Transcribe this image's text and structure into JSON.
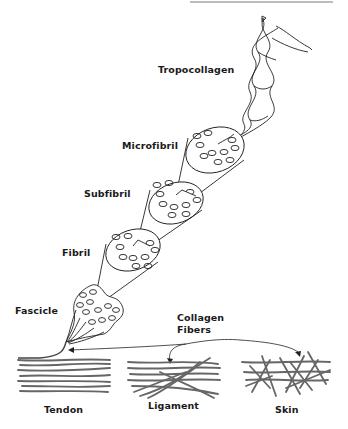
{
  "diagram": {
    "type": "collagen hierarchical structure",
    "labels": {
      "tropocollagen": "Tropocollagen",
      "microfibril": "Microfibril",
      "subfibril": "Subfibril",
      "fibril": "Fibril",
      "fascicle": "Fascicle",
      "collagen_fibers": "Collagen\nFibers",
      "tendon": "Tendon",
      "ligament": "Ligament",
      "skin": "Skin"
    },
    "hierarchy": [
      "Tropocollagen",
      "Microfibril",
      "Subfibril",
      "Fibril",
      "Fascicle",
      "Collagen Fibers"
    ],
    "tissues": [
      "Tendon",
      "Ligament",
      "Skin"
    ],
    "colors": {
      "line": "#222222",
      "fiber": "#555555",
      "background": "#ffffff",
      "top_rule": "#7a7a7a"
    }
  }
}
